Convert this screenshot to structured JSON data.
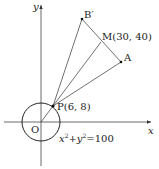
{
  "diagram": {
    "axes": {
      "x_label": "x",
      "y_label": "y",
      "origin_label": "O"
    },
    "circle": {
      "equation_lhs_x": "x",
      "equation_lhs_y": "y",
      "exponent": "2",
      "plus": "+",
      "equals": "=100"
    },
    "points": {
      "P": {
        "label": "P(6, 8)",
        "x": 6,
        "y": 8
      },
      "M": {
        "label": "M(30, 40)",
        "x": 30,
        "y": 40
      },
      "A": {
        "label": "A"
      },
      "B_prime": {
        "label": "B′"
      }
    },
    "colors": {
      "line": "#333333",
      "background": "#ffffff"
    }
  }
}
